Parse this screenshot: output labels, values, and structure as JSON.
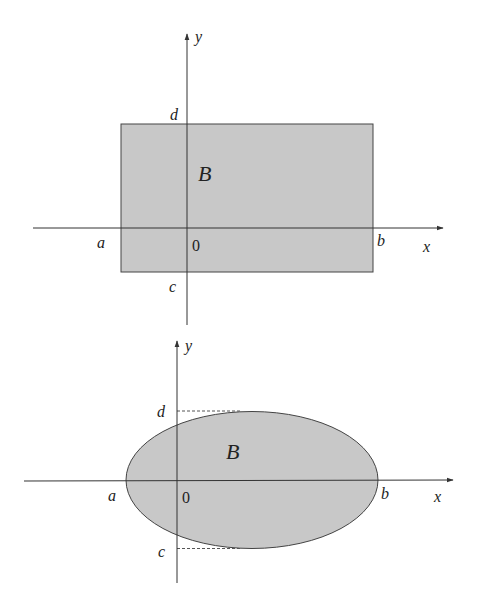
{
  "diagrams": [
    {
      "id": "rectangle",
      "region_label": "B",
      "axis_labels": {
        "x": "x",
        "y": "y"
      },
      "origin_label": "0",
      "bound_labels": {
        "a": "a",
        "b": "b",
        "c": "c",
        "d": "d"
      },
      "fill_color": "#c8c8c8",
      "stroke_color": "#444444"
    },
    {
      "id": "ellipse",
      "region_label": "B",
      "axis_labels": {
        "x": "x",
        "y": "y"
      },
      "origin_label": "0",
      "bound_labels": {
        "a": "a",
        "b": "b",
        "c": "c",
        "d": "d"
      },
      "fill_color": "#c8c8c8",
      "stroke_color": "#444444"
    }
  ]
}
